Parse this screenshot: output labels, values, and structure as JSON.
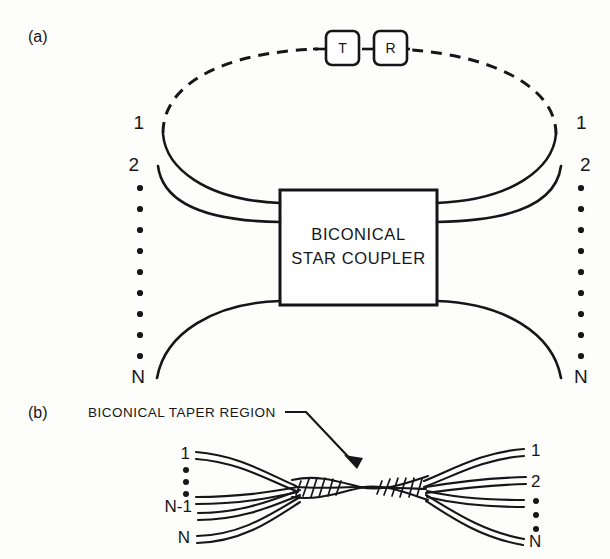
{
  "figure": {
    "background_color": "#fdfdfb",
    "ink_color": "#16161a",
    "panels": [
      {
        "id": "a",
        "label": "(a)",
        "coupler_box": {
          "line1": "BICONICAL",
          "line2": "STAR COUPLER"
        },
        "terminal_boxes": [
          {
            "name": "transmitter",
            "label": "T"
          },
          {
            "name": "receiver",
            "label": "R"
          }
        ],
        "left_ports": [
          "1",
          "2",
          "N"
        ],
        "right_ports": [
          "1",
          "2",
          "N"
        ],
        "left_ellipsis_dots": 9,
        "right_ellipsis_dots": 9
      },
      {
        "id": "b",
        "label": "(b)",
        "callout": "BICONICAL TAPER REGION",
        "left_ports": [
          "1",
          "N-1",
          "N"
        ],
        "right_ports": [
          "1",
          "2",
          "N"
        ],
        "left_ellipsis_dots": 3,
        "right_ellipsis_dots": 3
      }
    ]
  }
}
